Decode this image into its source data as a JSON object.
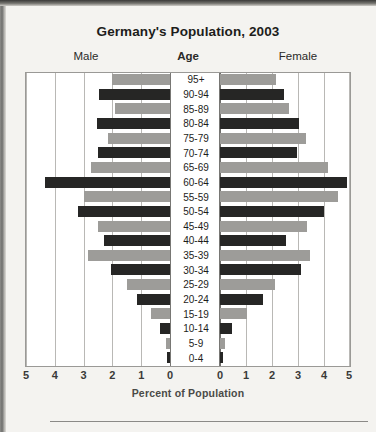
{
  "figure": {
    "title": "Germany's Population, 2003",
    "male_caption": "Male",
    "age_caption": "Age",
    "female_caption": "Female",
    "x_axis_title": "Percent of Population"
  },
  "axis": {
    "tick_labels_left": [
      "5",
      "4",
      "3",
      "2",
      "1",
      "0"
    ],
    "tick_labels_right": [
      "0",
      "1",
      "2",
      "3",
      "4",
      "5"
    ]
  },
  "colors": {
    "bar_dark": "#262625",
    "bar_light": "#9d9c99",
    "plot_background": "#ffffff",
    "page_background": "#f4f3f0",
    "gridline": "#b9b8b5",
    "axis_line": "#6e6d6a",
    "text": "#1d1d1b"
  },
  "chart_data": {
    "type": "bar",
    "subtype": "population-pyramid",
    "title": "Germany's Population, 2003",
    "xlabel": "Percent of Population",
    "ylabel": "Age",
    "xlim": [
      -5,
      5
    ],
    "xticks": [
      5,
      4,
      3,
      2,
      1,
      0,
      0,
      1,
      2,
      3,
      4,
      5
    ],
    "grid": true,
    "legend": "none",
    "categories": [
      "95+",
      "90-94",
      "85-89",
      "80-84",
      "75-79",
      "70-74",
      "65-69",
      "60-64",
      "55-59",
      "50-54",
      "45-49",
      "40-44",
      "35-39",
      "30-34",
      "25-29",
      "20-24",
      "15-19",
      "10-14",
      "5-9",
      "0-4"
    ],
    "series": [
      {
        "name": "Male",
        "side": "left",
        "values": [
          2.0,
          2.45,
          1.9,
          2.55,
          2.15,
          2.5,
          2.75,
          4.35,
          3.0,
          3.2,
          2.5,
          2.3,
          2.85,
          2.05,
          1.5,
          1.15,
          0.65,
          0.35,
          0.15,
          0.12
        ]
      },
      {
        "name": "Female",
        "side": "right",
        "values": [
          2.15,
          2.45,
          2.65,
          3.05,
          3.3,
          2.95,
          4.15,
          4.9,
          4.55,
          4.0,
          3.35,
          2.55,
          3.45,
          3.1,
          2.1,
          1.65,
          1.05,
          0.45,
          0.2,
          0.12
        ]
      }
    ]
  }
}
